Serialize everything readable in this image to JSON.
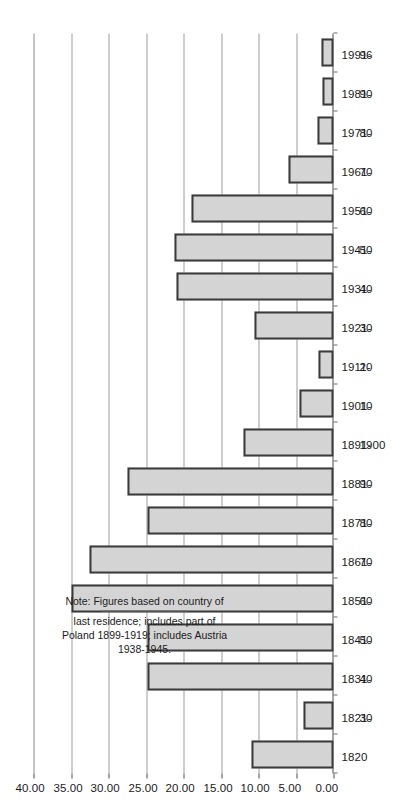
{
  "figure": {
    "kind": "rotated-bar-chart",
    "orientation": "page rotated 90 degrees; value axis 40.00 at left to 0.00 at right",
    "note_lines": [
      "Note: Figures based on country of",
      "last residence; includes part of",
      "Poland 1899-1919; includes Austria",
      "1938-1945."
    ],
    "note_text": "Note: Figures based on country of\nlast residence; includes part of\nPoland 1899-1919; includes Austria\n1938-1945.",
    "colors": {
      "bar_fill": "#d4d4d4",
      "bar_stroke": "#3a3a3a",
      "gridline": "#9b9b9b",
      "axis": "#4a4a4a",
      "text": "#1a1a1a",
      "background": "#ffffff"
    }
  },
  "chart_data": {
    "type": "bar",
    "title": "",
    "xlabel": "",
    "ylabel": "",
    "ylim": [
      0,
      40
    ],
    "grid": true,
    "legend": null,
    "tick_labels": [
      "0.00",
      "5.00",
      "10.00",
      "15.00",
      "20.00",
      "25.00",
      "30.00",
      "35.00",
      "40.00"
    ],
    "tick_values": [
      0,
      5,
      10,
      15,
      20,
      25,
      30,
      35,
      40
    ],
    "categories": [
      "1820",
      "1821-\n30",
      "1831-\n40",
      "1841-\n50",
      "1851-\n60",
      "1861-\n70",
      "1871-\n80",
      "1881-\n90",
      "1891-\n1900",
      "1901-\n10",
      "1911-\n20",
      "1921-\n30",
      "1931-\n40",
      "1941-\n50",
      "1951-\n60",
      "1961-\n70",
      "1971-\n80",
      "1981-\n90",
      "1991-\n96"
    ],
    "category_range_labels": [
      "1820",
      "1821-",
      "1831-",
      "1841-",
      "1851-",
      "1861-",
      "1871-",
      "1881-",
      "1891-",
      "1901-",
      "1911-",
      "1921-",
      "1931-",
      "1941-",
      "1951-",
      "1961-",
      "1971-",
      "1981-",
      "1991-"
    ],
    "category_end_labels": [
      "",
      "30",
      "40",
      "50",
      "60",
      "70",
      "80",
      "90",
      "1900",
      "10",
      "20",
      "30",
      "40",
      "50",
      "60",
      "70",
      "80",
      "90",
      "96"
    ],
    "values": [
      11.0,
      4.0,
      24.8,
      24.8,
      35.0,
      32.5,
      24.8,
      27.5,
      12.0,
      4.5,
      2.0,
      10.5,
      21.0,
      21.2,
      19.0,
      6.0,
      2.2,
      1.5,
      1.6
    ]
  }
}
